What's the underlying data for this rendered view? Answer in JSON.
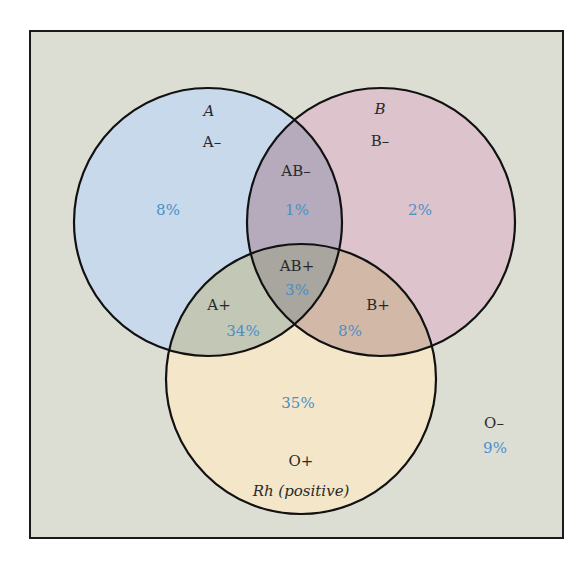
{
  "diagram": {
    "type": "venn",
    "sets": [
      {
        "id": "A",
        "label": "A",
        "color": "#c9d9ec"
      },
      {
        "id": "B",
        "label": "B",
        "color": "#dcc3cc"
      },
      {
        "id": "Rh",
        "label": "Rh (positive)",
        "color": "#f3e6c9"
      }
    ],
    "background_color": "#dcded3",
    "regions": {
      "a_neg": {
        "label": "A–",
        "percent": "8%"
      },
      "ab_neg": {
        "label": "AB–",
        "percent": "1%"
      },
      "b_neg": {
        "label": "B–",
        "percent": "2%"
      },
      "ab_pos": {
        "label": "AB+",
        "percent": "3%"
      },
      "a_pos": {
        "label": "A+",
        "percent": "34%"
      },
      "b_pos": {
        "label": "B+",
        "percent": "8%"
      },
      "o_pos": {
        "label": "O+",
        "percent": "35%"
      },
      "o_neg": {
        "label": "O–",
        "percent": "9%"
      }
    },
    "label_color": "#2a2a2a",
    "percent_color": "#4a8fc7"
  }
}
